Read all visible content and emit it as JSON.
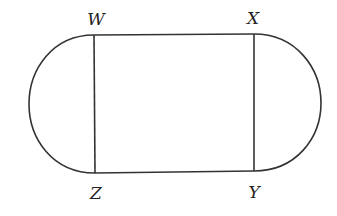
{
  "diagram": {
    "stroke_color": "#333333",
    "background_color": "#ffffff",
    "vertices": [
      {
        "id": "W",
        "label": "W",
        "position": "top-left"
      },
      {
        "id": "X",
        "label": "X",
        "position": "top-right"
      },
      {
        "id": "Y",
        "label": "Y",
        "position": "bottom-right"
      },
      {
        "id": "Z",
        "label": "Z",
        "position": "bottom-left"
      }
    ],
    "segments": [
      "WX",
      "XY",
      "YZ",
      "ZW"
    ],
    "arcs": [
      {
        "name": "left-semicircle",
        "endpoints": [
          "W",
          "Z"
        ],
        "side": "left"
      },
      {
        "name": "right-semicircle",
        "endpoints": [
          "X",
          "Y"
        ],
        "side": "right"
      }
    ]
  }
}
